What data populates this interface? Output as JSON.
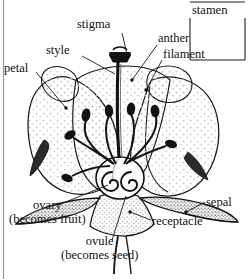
{
  "figure": {
    "background_color": "#ffffff",
    "ink_color": "#111111",
    "stipple_color": "#b9b9b9"
  },
  "labels": {
    "stigma": "stigma",
    "style": "style",
    "petal": "petal",
    "anther": "anther",
    "filament": "filament",
    "stamen": "stamen",
    "sepal": "sepal",
    "receptacle": "receptacle",
    "ovary_line1": "ovary",
    "ovary_line2": "(becomes fruit)",
    "ovule_line1": "ovule",
    "ovule_line2": "(becomes seed)"
  },
  "grouping": {
    "bracket_label": "stamen",
    "bracket_members": [
      "anther",
      "filament"
    ]
  },
  "parts": [
    "stigma",
    "style",
    "petal",
    "anther",
    "filament",
    "sepal",
    "receptacle",
    "ovary",
    "ovule"
  ]
}
